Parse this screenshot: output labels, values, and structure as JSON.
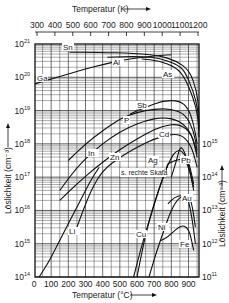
{
  "chart_data": {
    "type": "line",
    "title": "",
    "xlabel": "Temperatur (°C)",
    "x2label": "Temperatur (K)",
    "ylabel": "Löslichkeit (cm⁻³)",
    "y2label": "Löslichkeit (cm⁻³)",
    "xlim": [
      0,
      960
    ],
    "ylim_log10": [
      14,
      21
    ],
    "y2lim_log10": [
      11,
      15
    ],
    "x_ticks": [
      0,
      100,
      200,
      300,
      400,
      500,
      600,
      700,
      800,
      900
    ],
    "x2_ticks": [
      300,
      400,
      500,
      600,
      700,
      800,
      900,
      1000,
      1100,
      1200
    ],
    "y_ticks": [
      "10^14",
      "10^15",
      "10^16",
      "10^17",
      "10^18",
      "10^19",
      "10^20",
      "10^21"
    ],
    "y2_ticks": [
      "10^11",
      "10^12",
      "10^13",
      "10^14",
      "10^15"
    ],
    "grid": true,
    "y_scale": "log",
    "annotation": "s. rechte Skala",
    "series": [
      {
        "name": "Sn",
        "axis": "left",
        "x": [
          480,
          600,
          700,
          800,
          900,
          1000,
          1100,
          1180,
          1220,
          1240,
          1250
        ],
        "y_log10": [
          20.75,
          20.75,
          20.74,
          20.73,
          20.7,
          20.65,
          20.5,
          20.2,
          19.6,
          19.0,
          18.5
        ],
        "unit": "K"
      },
      {
        "name": "Al",
        "axis": "left",
        "x": [
          700,
          800,
          900,
          1000,
          1100,
          1150,
          1200,
          1230,
          1250
        ],
        "y_log10": [
          20.6,
          20.62,
          20.62,
          20.58,
          20.4,
          20.2,
          19.6,
          19.0,
          18.4
        ],
        "unit": "K"
      },
      {
        "name": "As",
        "axis": "left",
        "x": [
          900,
          1000,
          1100,
          1150,
          1200,
          1230,
          1250
        ],
        "y_log10": [
          20.55,
          20.5,
          20.3,
          20.0,
          19.4,
          18.8,
          18.2
        ],
        "unit": "K"
      },
      {
        "name": "Ga",
        "axis": "left",
        "x": [
          0,
          100,
          200,
          300,
          400,
          500,
          600,
          700,
          800
        ],
        "y_log10": [
          19.8,
          19.95,
          20.1,
          20.25,
          20.38,
          20.5,
          20.58,
          20.64,
          20.68
        ],
        "unit": "C"
      },
      {
        "name": "Sb",
        "axis": "left",
        "x": [
          560,
          650,
          750,
          850,
          900,
          930,
          950
        ],
        "y_log10": [
          18.9,
          19.1,
          19.3,
          19.3,
          19.05,
          18.6,
          18.0
        ],
        "unit": "C"
      },
      {
        "name": "P",
        "axis": "left",
        "x": [
          200,
          300,
          400,
          500,
          600,
          700,
          800,
          880,
          930,
          950
        ],
        "y_log10": [
          17.5,
          18.0,
          18.4,
          18.75,
          18.95,
          19.05,
          19.05,
          18.9,
          18.4,
          17.8
        ],
        "unit": "C"
      },
      {
        "name": "B",
        "axis": "left",
        "x": [
          150,
          250,
          350,
          450,
          550,
          650,
          750,
          850,
          920,
          950
        ],
        "y_log10": [
          16.6,
          17.3,
          17.8,
          18.2,
          18.5,
          18.7,
          18.8,
          18.7,
          18.3,
          17.7
        ],
        "unit": "C"
      },
      {
        "name": "In",
        "axis": "left",
        "x": [
          150,
          250,
          350,
          450,
          550,
          650,
          750,
          850,
          920,
          950
        ],
        "y_log10": [
          16.3,
          16.8,
          17.25,
          17.65,
          18.0,
          18.3,
          18.55,
          18.6,
          18.3,
          17.6
        ],
        "unit": "C"
      },
      {
        "name": "Zn",
        "axis": "left",
        "x": [
          250,
          330,
          400,
          500,
          600,
          700,
          800,
          870,
          920,
          950
        ],
        "y_log10": [
          15.5,
          16.6,
          17.2,
          17.6,
          17.9,
          18.15,
          18.3,
          18.25,
          17.9,
          17.3
        ],
        "unit": "C"
      },
      {
        "name": "Cd",
        "axis": "left",
        "x": [
          800,
          830,
          850,
          870,
          900,
          930
        ],
        "y_log10": [
          17.0,
          17.5,
          17.9,
          17.85,
          17.4,
          16.6
        ],
        "unit": "C"
      },
      {
        "name": "Ag",
        "axis": "right",
        "x": [
          600,
          650,
          700,
          750,
          800,
          830,
          860,
          900,
          930
        ],
        "y_log10": [
          11.0,
          12.3,
          13.2,
          14.0,
          14.6,
          14.8,
          14.8,
          14.5,
          13.8
        ],
        "unit": "C"
      },
      {
        "name": "Pb",
        "axis": "left",
        "x": [
          780,
          820,
          860,
          880,
          900,
          930
        ],
        "y_log10": [
          17.4,
          17.5,
          17.55,
          17.5,
          17.3,
          16.7
        ],
        "unit": "C"
      },
      {
        "name": "Li",
        "axis": "left",
        "x": [
          30,
          80,
          130,
          180,
          230,
          280,
          330,
          380
        ],
        "y_log10": [
          14.0,
          14.4,
          14.9,
          15.4,
          15.9,
          16.4,
          16.9,
          17.3
        ],
        "unit": "C"
      },
      {
        "name": "Au",
        "axis": "right",
        "x": [
          780,
          820,
          860,
          880,
          900,
          920,
          940
        ],
        "y_log10": [
          13.2,
          13.4,
          13.45,
          13.45,
          13.3,
          12.8,
          12.0
        ],
        "unit": "C"
      },
      {
        "name": "Cu",
        "axis": "right",
        "x": [
          580,
          620,
          660,
          700,
          740,
          780
        ],
        "y_log10": [
          11.0,
          11.8,
          12.5,
          13.2,
          13.8,
          14.4
        ],
        "unit": "C"
      },
      {
        "name": "Ni",
        "axis": "right",
        "x": [
          670,
          710,
          750,
          790,
          830,
          870,
          900,
          920,
          940
        ],
        "y_log10": [
          11.0,
          11.7,
          12.3,
          12.9,
          13.3,
          13.45,
          13.45,
          13.2,
          12.5
        ],
        "unit": "C"
      },
      {
        "name": "Fe",
        "axis": "right",
        "x": [
          740,
          780,
          820,
          860,
          890,
          910,
          930
        ],
        "y_log10": [
          12.1,
          12.2,
          12.4,
          12.55,
          12.5,
          12.3,
          11.8
        ],
        "unit": "C"
      }
    ]
  },
  "labels": {
    "top_axis_title": "Temperatur (K)",
    "bottom_axis_title": "Temperatur (°C)",
    "left_axis_title": "Löslichkeit (cm⁻³)",
    "right_axis_title": "Löslichkeit (cm⁻³)",
    "annotation": "s. rechte Skala",
    "curves": [
      {
        "text": "Sn",
        "x": 63,
        "y": 50
      },
      {
        "text": "Al",
        "x": 113,
        "y": 65
      },
      {
        "text": "As",
        "x": 163,
        "y": 77
      },
      {
        "text": "Ga",
        "x": 37,
        "y": 81
      },
      {
        "text": "Sb",
        "x": 137,
        "y": 108
      },
      {
        "text": "P",
        "x": 124,
        "y": 123
      },
      {
        "text": "In",
        "x": 88,
        "y": 156
      },
      {
        "text": "Zn",
        "x": 110,
        "y": 160
      },
      {
        "text": "Cd",
        "x": 159,
        "y": 137
      },
      {
        "text": "Ag",
        "x": 148,
        "y": 163
      },
      {
        "text": "Pb",
        "x": 181,
        "y": 163
      },
      {
        "text": "Li",
        "x": 69,
        "y": 234
      },
      {
        "text": "Au",
        "x": 182,
        "y": 201
      },
      {
        "text": "Ni",
        "x": 158,
        "y": 230
      },
      {
        "text": "Cu",
        "x": 136,
        "y": 237
      },
      {
        "text": "Fe",
        "x": 180,
        "y": 247
      }
    ]
  }
}
